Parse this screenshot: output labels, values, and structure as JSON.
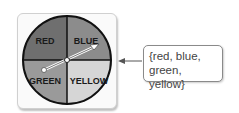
{
  "spinner": {
    "sections": [
      {
        "label": "RED",
        "color": "#6f6f6f"
      },
      {
        "label": "BLUE",
        "color": "#8c8c8c"
      },
      {
        "label": "GREEN",
        "color": "#9a9a9a"
      },
      {
        "label": "YELLOW",
        "color": "#d6d6d6"
      }
    ]
  },
  "callout": {
    "line1": "{red, blue,",
    "line2": "green, yellow}"
  }
}
